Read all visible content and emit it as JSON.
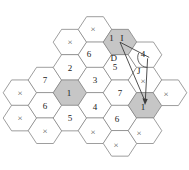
{
  "diagram": {
    "type": "hexagonal-cell-grid",
    "colors": {
      "background": "#ffffff",
      "hex_fill": "#ffffff",
      "hex_shaded_fill": "#c6c6c6",
      "hex_stroke": "#7d7d7d",
      "line_color": "#3c3c3c",
      "number_color": "#222222",
      "cross_color": "#5a5a5a"
    },
    "grid": {
      "origin_x": 20,
      "col_step": 25,
      "origin_y": 29.5,
      "half_row_step": 12.65,
      "hex_half_width": 16.8,
      "hex_quarter_width": 8.4,
      "hex_half_height": 12.8,
      "number_font_size": 9,
      "cross_font_size": 9,
      "label_font_size": 9
    },
    "cells": [
      {
        "col": 0,
        "row": 5,
        "label": "×",
        "kind": "cross",
        "shaded": false,
        "dx": 0,
        "dy": 0
      },
      {
        "col": 0,
        "row": 7,
        "label": "×",
        "kind": "cross",
        "shaded": false,
        "dx": 0,
        "dy": 0
      },
      {
        "col": 1,
        "row": 4,
        "label": "7",
        "kind": "number",
        "shaded": false,
        "dx": 0,
        "dy": 0
      },
      {
        "col": 1,
        "row": 6,
        "label": "6",
        "kind": "number",
        "shaded": false,
        "dx": 0,
        "dy": 0
      },
      {
        "col": 1,
        "row": 8,
        "label": "×",
        "kind": "cross",
        "shaded": false,
        "dx": 0,
        "dy": 0
      },
      {
        "col": 2,
        "row": 1,
        "label": "×",
        "kind": "cross",
        "shaded": false,
        "dx": 0,
        "dy": 0
      },
      {
        "col": 2,
        "row": 3,
        "label": "2",
        "kind": "number",
        "shaded": false,
        "dx": 0,
        "dy": 0
      },
      {
        "col": 2,
        "row": 5,
        "label": "1",
        "kind": "number",
        "shaded": true,
        "dx": -1,
        "dy": 0
      },
      {
        "col": 2,
        "row": 7,
        "label": "5",
        "kind": "number",
        "shaded": false,
        "dx": 0,
        "dy": 0
      },
      {
        "col": 3,
        "row": 0,
        "label": "×",
        "kind": "cross",
        "shaded": false,
        "dx": -2,
        "dy": -1
      },
      {
        "col": 3,
        "row": 2,
        "label": "6",
        "kind": "number",
        "shaded": false,
        "dx": -6,
        "dy": -1
      },
      {
        "col": 3,
        "row": 4,
        "label": "3",
        "kind": "number",
        "shaded": false,
        "dx": 0,
        "dy": 0
      },
      {
        "col": 3,
        "row": 6,
        "label": "4",
        "kind": "number",
        "shaded": false,
        "dx": 0,
        "dy": 1
      },
      {
        "col": 3,
        "row": 8,
        "label": "×",
        "kind": "cross",
        "shaded": false,
        "dx": -2,
        "dy": 1
      },
      {
        "col": 4,
        "row": 1,
        "label": "1",
        "kind": "number",
        "shaded": true,
        "dx": -8.5,
        "dy": -4
      },
      {
        "col": 4,
        "row": 3,
        "label": "5",
        "kind": "number",
        "shaded": false,
        "dx": -5,
        "dy": -1
      },
      {
        "col": 4,
        "row": 5,
        "label": "7",
        "kind": "number",
        "shaded": false,
        "dx": 0,
        "dy": 0
      },
      {
        "col": 4,
        "row": 7,
        "label": "6",
        "kind": "number",
        "shaded": false,
        "dx": -3,
        "dy": 1
      },
      {
        "col": 4,
        "row": 9,
        "label": "×",
        "kind": "cross",
        "shaded": false,
        "dx": -4,
        "dy": 1
      },
      {
        "col": 5,
        "row": 2,
        "label": "4",
        "kind": "number",
        "shaded": false,
        "dx": -2,
        "dy": -1
      },
      {
        "col": 5,
        "row": 4,
        "label": "×",
        "kind": "cross",
        "shaded": false,
        "dx": -2,
        "dy": 1
      },
      {
        "col": 5,
        "row": 6,
        "label": "1",
        "kind": "number",
        "shaded": true,
        "dx": -2,
        "dy": 1
      },
      {
        "col": 5,
        "row": 8,
        "label": "×",
        "kind": "cross",
        "shaded": false,
        "dx": -6,
        "dy": 2
      },
      {
        "col": 6,
        "row": 5,
        "label": "×",
        "kind": "cross",
        "shaded": false,
        "dx": -4,
        "dy": 1
      }
    ],
    "annotations": {
      "labels": [
        {
          "name": "i-label",
          "text": "I",
          "x": 120.5,
          "y": 40.5
        },
        {
          "name": "d-label",
          "text": "D",
          "x": 110.5,
          "y": 60.5
        },
        {
          "name": "j-label",
          "text": "J",
          "x": 137.0,
          "y": 73.5
        }
      ],
      "lines": [
        {
          "name": "i-vector-line",
          "x1": 120,
          "y1": 42.2,
          "x2": 149.2,
          "y2": 57.4
        },
        {
          "name": "j-vector-line",
          "x1": 147.6,
          "y1": 58.4,
          "x2": 145.3,
          "y2": 100.8
        },
        {
          "name": "distance-line",
          "x1": 120,
          "y1": 42.2,
          "x2": 144.6,
          "y2": 100.2
        }
      ],
      "angle_arc": {
        "name": "angle-arc",
        "path": "M 138.8,52.8 A 10,10 0 0 0 147.2,67.4"
      },
      "arrow_head": {
        "name": "arrow-head",
        "points": "145,105 142.5,98.3 147.7,98.9"
      }
    }
  }
}
